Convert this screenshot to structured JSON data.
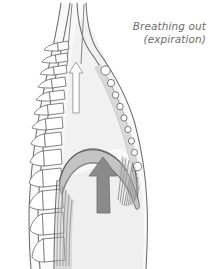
{
  "figure": {
    "name": "respiratory-mechanics-expiration-diagram",
    "caption": {
      "line1": "Breathing out",
      "line2": "(expiration)"
    },
    "colors": {
      "background": "#ffffff",
      "outline": "#58585a",
      "light_outline": "#8c8c8e",
      "cavity_fill": "#f2f2f2",
      "body_fill": "#f7f7f7",
      "bone_fill": "#ffffff",
      "cartilage_fill": "#ffffff",
      "sternum_band_fill": "#d9d9d9",
      "diaphragm_fill": "#c9c9c9",
      "solid_arrow_fill": "#8a8a8a",
      "solid_arrow_stroke": "#6f6f6f",
      "outline_arrow_fill": "#fcfcfc",
      "outline_arrow_stroke": "#9a9a9c",
      "caption_text": "#6d6d6d"
    },
    "parts": [
      {
        "name": "vertebral-column",
        "label": "Vertebral column",
        "vertebra_count": 12
      },
      {
        "name": "trachea",
        "label": "Trachea"
      },
      {
        "name": "thoracic-cavity",
        "label": "Thoracic cavity"
      },
      {
        "name": "sternum",
        "label": "Sternum"
      },
      {
        "name": "costal-cartilage-chain",
        "label": "Costal cartilages",
        "node_count": 9
      },
      {
        "name": "diaphragm",
        "label": "Diaphragm"
      },
      {
        "name": "abdominal-cavity",
        "label": "Abdominal cavity"
      },
      {
        "name": "airflow-arrow",
        "label": "Air flowing out (upward)",
        "direction": "up"
      },
      {
        "name": "diaphragm-arrow",
        "label": "Diaphragm moving up",
        "direction": "up"
      }
    ],
    "vertebrae": [
      {
        "index": 1,
        "y": 48,
        "size": "small"
      },
      {
        "index": 2,
        "y": 60,
        "size": "small"
      },
      {
        "index": 3,
        "y": 72,
        "size": "small"
      },
      {
        "index": 4,
        "y": 85,
        "size": "small"
      },
      {
        "index": 5,
        "y": 98,
        "size": "medium"
      },
      {
        "index": 6,
        "y": 112,
        "size": "medium"
      },
      {
        "index": 7,
        "y": 127,
        "size": "medium"
      },
      {
        "index": 8,
        "y": 143,
        "size": "medium"
      },
      {
        "index": 9,
        "y": 161,
        "size": "large"
      },
      {
        "index": 10,
        "y": 182,
        "size": "large"
      },
      {
        "index": 11,
        "y": 205,
        "size": "large"
      },
      {
        "index": 12,
        "y": 230,
        "size": "large"
      }
    ],
    "cartilage_nodes": [
      {
        "index": 1,
        "cx": 105.5,
        "cy": 70.5,
        "r": 4.6
      },
      {
        "index": 2,
        "cx": 111.0,
        "cy": 83.0,
        "r": 3.6
      },
      {
        "index": 3,
        "cx": 115.5,
        "cy": 95.0,
        "r": 3.3
      },
      {
        "index": 4,
        "cx": 120.0,
        "cy": 106.5,
        "r": 3.2
      },
      {
        "index": 5,
        "cx": 124.0,
        "cy": 118.0,
        "r": 3.1
      },
      {
        "index": 6,
        "cx": 128.0,
        "cy": 129.5,
        "r": 3.1
      },
      {
        "index": 7,
        "cx": 131.5,
        "cy": 141.0,
        "r": 3.1
      },
      {
        "index": 8,
        "cx": 134.5,
        "cy": 152.5,
        "r": 3.1
      },
      {
        "index": 9,
        "cx": 137.5,
        "cy": 166.5,
        "r": 4.3
      }
    ]
  }
}
